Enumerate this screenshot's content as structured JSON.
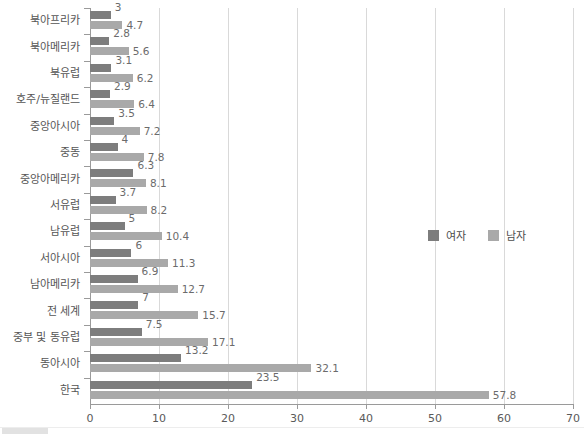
{
  "chart_data": {
    "type": "bar",
    "orientation": "horizontal",
    "title": "",
    "xlabel": "",
    "ylabel": "",
    "xlim": [
      0,
      70
    ],
    "xticks": [
      "0",
      "10",
      "20",
      "30",
      "40",
      "50",
      "60",
      "70"
    ],
    "grid": true,
    "legend_position": "center-right",
    "categories": [
      "북아프리카",
      "북아메리카",
      "북유럽",
      "호주/뉴질랜드",
      "중앙아시아",
      "중동",
      "중앙아메리카",
      "서유럽",
      "남유럽",
      "서아시아",
      "남아메리카",
      "전 세계",
      "중부 및 동유럽",
      "동아시아",
      "한국"
    ],
    "series": [
      {
        "name": "여자",
        "color": "#7d7d7d",
        "values": [
          3,
          2.8,
          3.1,
          2.9,
          3.5,
          4,
          6.3,
          3.7,
          5,
          6,
          6.9,
          7,
          7.5,
          13.2,
          23.5
        ],
        "labels": [
          "3",
          "2.8",
          "3.1",
          "2.9",
          "3.5",
          "4",
          "6.3",
          "3.7",
          "5",
          "6",
          "6.9",
          "7",
          "7.5",
          "13.2",
          "23.5"
        ]
      },
      {
        "name": "남자",
        "color": "#a9a9a9",
        "values": [
          4.7,
          5.6,
          6.2,
          6.4,
          7.2,
          7.8,
          8.1,
          8.2,
          10.4,
          11.3,
          12.7,
          15.7,
          17.1,
          32.1,
          57.8
        ],
        "labels": [
          "4.7",
          "5.6",
          "6.2",
          "6.4",
          "7.2",
          "7.8",
          "8.1",
          "8.2",
          "10.4",
          "11.3",
          "12.7",
          "15.7",
          "17.1",
          "32.1",
          "57.8"
        ]
      }
    ]
  },
  "legend": {
    "items": [
      {
        "label": "여자",
        "color": "#7d7d7d"
      },
      {
        "label": "남자",
        "color": "#a9a9a9"
      }
    ]
  }
}
